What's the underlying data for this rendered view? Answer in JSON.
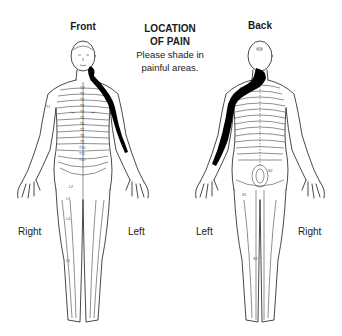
{
  "header": {
    "front_label": "Front",
    "back_label": "Back",
    "title_line1": "LOCATION",
    "title_line2": "OF PAIN",
    "instruction_line1": "Please shade in",
    "instruction_line2": "painful areas."
  },
  "front_figure": {
    "side_labels": {
      "right": "Right",
      "left": "Left"
    },
    "dermatome_labels": [
      "C3",
      "T1",
      "T2",
      "T3",
      "T4",
      "T5",
      "T6",
      "T7",
      "T8",
      "T9",
      "T10",
      "T11",
      "T12",
      "L1",
      "L2",
      "L3",
      "L4",
      "L5",
      "T1"
    ],
    "shaded_region": "left neck, shoulder and upper arm"
  },
  "back_figure": {
    "side_labels": {
      "left": "Left",
      "right": "Right"
    },
    "dermatome_labels": [
      "S2",
      "S1",
      "S2"
    ],
    "shaded_region": "left neck, shoulder and arm"
  },
  "colors": {
    "ink": "#1a1a1a",
    "shading": "#000000",
    "background": "#ffffff"
  }
}
